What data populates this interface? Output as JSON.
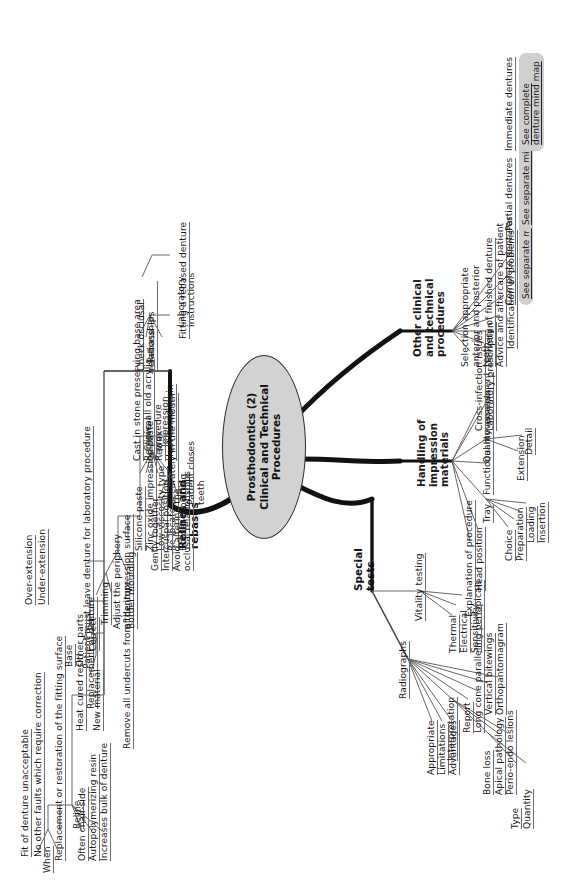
{
  "central": {
    "line1": "Prosthodontics (2)",
    "line2": "Clinical and Technical",
    "line3": "Procedures"
  },
  "colors": {
    "central_fill": "#d2d2d2",
    "central_stroke": "#2b2b2b",
    "branch_line": "#555555",
    "callout_fill": "#cfcfcf",
    "text": "#1a1a1a"
  },
  "branches": {
    "relines_and_rebases": {
      "label_line1": "Relines and",
      "label_line2": "rebases",
      "reline": {
        "label": "Reline",
        "when": {
          "label": "When",
          "items": [
            "Fit of denture unacceptable",
            "No other faults which require correction"
          ]
        },
        "definition": "Replacement or restoration of the fitting surface",
        "items": [
          "Often chair-side",
          "Autopolymerizing resin",
          "Increases bulk of denture"
        ]
      },
      "rebase": {
        "label": "Rebase",
        "note": "Patient must leave denture for laboratory procedure",
        "replacement_of_denture": {
          "label": "Replacement of denture",
          "items": [
            "Base",
            "Other parts"
          ]
        },
        "new_material": {
          "label": "New material",
          "items": [
            "Heat cured resin"
          ]
        },
        "clinical_procedure": {
          "label_line1": "Clinical",
          "label_line2": "procedure",
          "items": [
            "Remove all undercuts from the impression surface"
          ],
          "adjust_periphery": {
            "label_line1": "Adjust the periphery",
            "label_line2": "of denture",
            "children": [
              {
                "label": "Trimming",
                "items": [
                  "Correct",
                  "Over-extension",
                  "Under-extension"
                ]
              },
              {
                "label": "Border moulding",
                "items": []
              }
            ]
          },
          "impression": {
            "label": "Impression",
            "materials": [
              "Silicone paste",
              "Zinc oxide impression paste",
              "Low-viscosity type"
            ],
            "steps": [
              "Re-locate accurately in the mouth",
              "Border moulding"
            ],
            "patient_closes_teeth": {
              "label_line1": "Patient closes",
              "label_line2": "teeth",
              "items": [
                "Gently together",
                "Intercuspal position",
                "Avoid altering the occlusal relationships"
              ]
            }
          }
        },
        "laboratory_instructions": {
          "label_line1": "Laboratory",
          "label_line2": "instructions",
          "items": [
            "Cast in stone preserving base area",
            "Remove all old acrylic",
            "Rewax",
            "Heat cured resin"
          ]
        },
        "fitting_a_rebased_denture": {
          "label": "Fitting a rebased denture",
          "items": [
            "Check occlusal relationships"
          ]
        }
      }
    },
    "special_tests": {
      "label_line1": "Special",
      "label_line2": "tests",
      "radiographs": {
        "label": "Radiographs",
        "items": [
          "Appropriate",
          "Limitations",
          "Advantages"
        ],
        "interpretation": {
          "label": "Interpretation",
          "bone_loss": {
            "label": "Bone loss",
            "items": [
              "Type",
              "Quantity"
            ]
          },
          "items": [
            "Apical pathology",
            "Perio-endo lesions"
          ]
        },
        "more": [
          "Report",
          "Long cone paralleling periapicals",
          "Vertical bitewings",
          "Orthopantomagram"
        ]
      },
      "vitality_testing": {
        "label": "Vitality testing",
        "items": [
          "Thermal",
          "Electrical",
          "Sensitivity"
        ]
      }
    },
    "handling_of_impression_materials": {
      "label_line1": "Handling of",
      "label_line2": "impression",
      "label_line3": "materials",
      "items_before": [
        "Explanation of procedure",
        "Head position"
      ],
      "tray": {
        "label": "Tray",
        "items": [
          "Choice",
          "Preparation",
          "Loading",
          "Insertion"
        ]
      },
      "functional_movements": "Functional movements",
      "quality_assessment": {
        "label": "Quality assessment",
        "items": [
          "Extension",
          "Detail"
        ]
      },
      "items_after": [
        "Cross-infection issues",
        "Laboratory prescription"
      ]
    },
    "other_clinical_and_technical_procedures": {
      "label_line1": "Other clinical",
      "label_line2": "and technical",
      "label_line3": "procedures",
      "items": [
        "Selection appropriate anterior and posterior teeth",
        "Delivery of finished denture",
        "Advice and aftercare of patient",
        "Identification of problems"
      ],
      "links": [
        {
          "label": "Complete dentures",
          "note": "See separate mind map"
        },
        {
          "label": "Partial dentures",
          "note": "See separate mind map"
        },
        {
          "label": "Immediate dentures",
          "note_line1": "See complete",
          "note_line2": "denture mind map"
        }
      ]
    }
  }
}
